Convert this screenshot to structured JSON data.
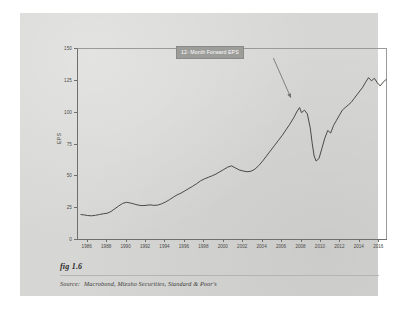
{
  "figure": {
    "number": "fig 1.6",
    "source_lead": "Source:",
    "source_text": "Macrobond, Mizuho Securities, Standard & Poor's"
  },
  "annotation": {
    "label": "12- Month Forward EPS"
  },
  "colors": {
    "page": "#ffffff",
    "card": "#d6d6d4",
    "line": "#3a3a38",
    "axis": "#6f6f6d",
    "annotation_bg": "#9c9c99",
    "annotation_text": "#ffffff"
  },
  "chart_data": {
    "type": "line",
    "title": "",
    "subtitle": "",
    "xlabel": "",
    "ylabel": "EPS",
    "xlim": [
      1985.0,
      2016.9
    ],
    "ylim": [
      0,
      150
    ],
    "grid": false,
    "legend": "none",
    "annotations": [
      {
        "text": "12- Month Forward EPS",
        "label_x": 2005.0,
        "label_y": 146,
        "arrow_to_x": 2007.0,
        "arrow_to_y": 111
      }
    ],
    "yticks": [
      0,
      25,
      50,
      75,
      100,
      125,
      150
    ],
    "ytick_labels": [
      "0",
      "25",
      "50",
      "75",
      "100",
      "125",
      "150"
    ],
    "xticks": [
      1986,
      1988,
      1990,
      1992,
      1994,
      1996,
      1998,
      2000,
      2002,
      2004,
      2006,
      2008,
      2010,
      2012,
      2014,
      2016
    ],
    "xtick_labels": [
      "1986",
      "1988",
      "1990",
      "1992",
      "1994",
      "1996",
      "1998",
      "2000",
      "2002",
      "2004",
      "2006",
      "2008",
      "2010",
      "2012",
      "2014",
      "2016"
    ],
    "series": [
      {
        "name": "12-Month Forward EPS",
        "color": "#3a3a38",
        "x": [
          1985.3,
          1985.7,
          1986.0,
          1986.4,
          1986.8,
          1987.2,
          1987.6,
          1988.0,
          1988.4,
          1988.8,
          1989.2,
          1989.6,
          1990.0,
          1990.4,
          1990.8,
          1991.2,
          1991.6,
          1992.0,
          1992.4,
          1992.8,
          1993.2,
          1993.6,
          1994.0,
          1994.4,
          1994.8,
          1995.2,
          1995.6,
          1996.0,
          1996.4,
          1996.8,
          1997.2,
          1997.6,
          1998.0,
          1998.4,
          1998.8,
          1999.2,
          1999.6,
          2000.0,
          2000.4,
          2000.8,
          2001.2,
          2001.6,
          2002.0,
          2002.4,
          2002.8,
          2003.2,
          2003.6,
          2004.0,
          2004.4,
          2004.8,
          2005.2,
          2005.6,
          2006.0,
          2006.4,
          2006.8,
          2007.2,
          2007.5,
          2007.8,
          2008.0,
          2008.3,
          2008.6,
          2008.9,
          2009.1,
          2009.3,
          2009.5,
          2009.8,
          2010.1,
          2010.4,
          2010.7,
          2011.0,
          2011.3,
          2011.6,
          2011.9,
          2012.2,
          2012.5,
          2012.8,
          2013.1,
          2013.4,
          2013.7,
          2014.0,
          2014.3,
          2014.6,
          2014.9,
          2015.2,
          2015.5,
          2015.8,
          2016.1,
          2016.4,
          2016.7
        ],
        "y": [
          20.0,
          19.6,
          19.2,
          19.0,
          19.4,
          20.0,
          20.6,
          21.0,
          22.4,
          24.6,
          26.8,
          28.8,
          29.6,
          29.0,
          28.2,
          27.4,
          27.0,
          27.2,
          27.6,
          27.2,
          27.4,
          28.4,
          29.8,
          31.6,
          33.6,
          35.4,
          36.8,
          38.6,
          40.4,
          42.2,
          44.2,
          46.4,
          48.0,
          49.2,
          50.4,
          51.8,
          53.6,
          55.4,
          57.2,
          58.2,
          56.6,
          55.0,
          54.2,
          53.6,
          54.0,
          55.6,
          58.4,
          62.0,
          66.0,
          70.0,
          74.0,
          78.0,
          82.0,
          86.5,
          91.0,
          96.0,
          100.5,
          104.0,
          100.0,
          102.0,
          99.0,
          88.0,
          76.0,
          66.0,
          62.0,
          64.0,
          72.0,
          80.0,
          86.0,
          84.0,
          90.0,
          94.0,
          98.0,
          102.0,
          104.0,
          106.0,
          108.0,
          111.0,
          114.0,
          117.0,
          120.0,
          124.0,
          127.5,
          125.0,
          127.0,
          123.5,
          121.0,
          124.0,
          126.0
        ]
      }
    ]
  }
}
